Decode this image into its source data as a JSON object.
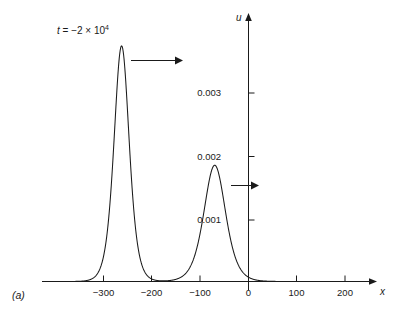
{
  "figure": {
    "panel_label": "(a)",
    "line_color": "#1a1a1a",
    "background_color": "#ffffff"
  },
  "annotation": {
    "time_label_var": "t",
    "time_label_eq": " = −2 × 10",
    "time_label_exp": "4",
    "arrow_big_name": "propagation-arrow-large-soliton",
    "arrow_small_name": "propagation-arrow-small-soliton"
  },
  "axes": {
    "x_name": "x",
    "y_name": "u",
    "x_ticks": [
      "−300",
      "−200",
      "−100",
      "0",
      "100",
      "200"
    ],
    "y_ticks": [
      "0.003",
      "0.002",
      "0.001"
    ]
  },
  "chart_data": {
    "type": "line",
    "title": "",
    "subtitle": "",
    "xlabel": "x",
    "ylabel": "u",
    "annotations": [
      {
        "text": "t = −2 × 10^4",
        "x": -300,
        "y": 0.00395
      },
      {
        "text": "(a)",
        "x": -400,
        "y": -0.0004
      }
    ],
    "grid": false,
    "legend": false,
    "xlim": [
      -420,
      260
    ],
    "ylim": [
      0,
      0.0042
    ],
    "xticks": [
      -300,
      -200,
      -100,
      0,
      100,
      200
    ],
    "yticks": [
      0.001,
      0.002,
      0.003
    ],
    "ytick_labels": [
      "0.001",
      "0.002",
      "0.003"
    ],
    "xtick_labels": [
      "−300",
      "−200",
      "−100",
      "0",
      "100",
      "200"
    ],
    "series": [
      {
        "name": "u(x, t = -2e4)",
        "description": "Two-soliton KdV profile: tall narrow sech^2 peak plus shorter broader sech^2 peak",
        "components": [
          {
            "peak_x": -263,
            "peak_y": 0.00375,
            "width": 21
          },
          {
            "peak_x": -70,
            "peak_y": 0.00185,
            "width": 30
          }
        ],
        "x": [
          -420,
          -400,
          -380,
          -360,
          -340,
          -330,
          -320,
          -310,
          -300,
          -295,
          -290,
          -285,
          -280,
          -275,
          -270,
          -265,
          -263,
          -260,
          -255,
          -250,
          -245,
          -240,
          -235,
          -230,
          -225,
          -215,
          -205,
          -195,
          -185,
          -175,
          -165,
          -155,
          -145,
          -135,
          -125,
          -115,
          -105,
          -95,
          -85,
          -75,
          -70,
          -65,
          -55,
          -45,
          -35,
          -25,
          -15,
          -5,
          0,
          5,
          15,
          25,
          40,
          60,
          100,
          150,
          200,
          250
        ],
        "y": [
          0.00022,
          0.00024,
          0.00027,
          0.00031,
          0.00038,
          0.00043,
          0.0005,
          0.0006,
          0.00078,
          0.00098,
          0.00132,
          0.00185,
          0.00252,
          0.00311,
          0.00355,
          0.00374,
          0.00375,
          0.00371,
          0.0034,
          0.00286,
          0.00219,
          0.00158,
          0.0011,
          0.00077,
          0.00056,
          0.00033,
          0.00024,
          0.00021,
          0.00022,
          0.00026,
          0.00033,
          0.00045,
          0.00064,
          0.00092,
          0.00128,
          0.0016,
          0.00178,
          0.00184,
          0.00178,
          0.00163,
          0.00152,
          0.00137,
          0.00104,
          0.00073,
          0.00048,
          0.0003,
          0.00017,
          9e-05,
          6e-05,
          4e-05,
          2e-05,
          1e-05,
          0.0,
          0.0,
          0.0,
          0.0,
          0.0,
          0.0
        ]
      }
    ]
  }
}
